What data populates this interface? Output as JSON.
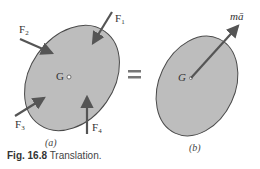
{
  "figure": {
    "caption_number": "Fig. 16.8",
    "caption_text": "Translation.",
    "panel_a_label": "(a)",
    "panel_b_label": "(b)",
    "equals_sign": "=",
    "panel_a": {
      "center_label": "G",
      "forces": [
        {
          "label": "F",
          "subscript": "1"
        },
        {
          "label": "F",
          "subscript": "2"
        },
        {
          "label": "F",
          "subscript": "3"
        },
        {
          "label": "F",
          "subscript": "4"
        }
      ]
    },
    "panel_b": {
      "center_label": "G",
      "resultant_label": "mā"
    },
    "colors": {
      "body_fill": "#bdbdbd",
      "outline": "#4a4a4a",
      "arrow": "#555555",
      "text": "#333333"
    }
  }
}
